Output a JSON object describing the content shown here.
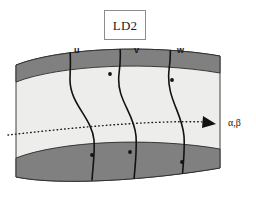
{
  "figure": {
    "title_box": {
      "text": "LD2"
    },
    "curve_labels": [
      {
        "text": "u",
        "x": 74,
        "y": 46
      },
      {
        "text": "v",
        "x": 134,
        "y": 46
      },
      {
        "text": "w",
        "x": 177,
        "y": 46
      },
      {
        "text": "α,β",
        "x": 228,
        "y": 124
      }
    ],
    "colors": {
      "band_dark": "#808080",
      "band_interior": "#ededeb",
      "outline": "#1a1a1a",
      "box_border": "#8c8c8c",
      "background": "#ffffff"
    },
    "icon_names": {
      "arrow": "arrow-right-icon",
      "dotted_path": "dotted-trajectory-icon",
      "node": "node-dot-icon"
    },
    "geometry": {
      "band_top_outer_left_y": 65,
      "band_top_inner_left_y": 82,
      "band_bottom_inner_left_y": 158,
      "band_bottom_outer_left_y": 177,
      "band_top_outer_right_y": 56,
      "band_bottom_outer_right_y": 168,
      "left_edge_x": 16,
      "right_edge_x": 220
    }
  }
}
